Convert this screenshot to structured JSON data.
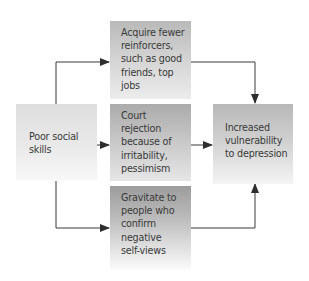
{
  "diagram": {
    "type": "flowchart",
    "nodes": {
      "poor_social_skills": {
        "label": "Poor social\nskills"
      },
      "acquire_fewer": {
        "label": "Acquire fewer\nreinforcers,\nsuch as good\nfriends, top\njobs"
      },
      "court_rejection": {
        "label": "Court\nrejection\nbecause of\nirritability,\npessimism"
      },
      "gravitate": {
        "label": "Gravitate to\npeople who\nconfirm\nnegative\nself-views"
      },
      "increased_vulnerability": {
        "label": "Increased\nvulnerability\nto depression"
      }
    },
    "edges": [
      {
        "from": "poor_social_skills",
        "to": "acquire_fewer"
      },
      {
        "from": "poor_social_skills",
        "to": "court_rejection"
      },
      {
        "from": "poor_social_skills",
        "to": "gravitate"
      },
      {
        "from": "acquire_fewer",
        "to": "increased_vulnerability"
      },
      {
        "from": "court_rejection",
        "to": "increased_vulnerability"
      },
      {
        "from": "gravitate",
        "to": "increased_vulnerability"
      }
    ],
    "colors": {
      "arrow": "#333333",
      "text": "#3a3a3a"
    }
  }
}
